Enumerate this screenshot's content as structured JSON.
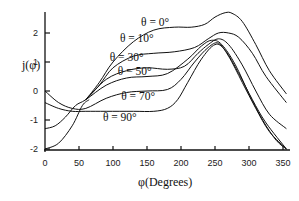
{
  "chart_data": {
    "type": "line",
    "title": "",
    "xlabel": "φ(Degrees)",
    "ylabel": "j(φ)",
    "xlim": [
      0,
      360
    ],
    "ylim": [
      -2,
      2.7
    ],
    "grid": false,
    "legend": "inline labels",
    "xticks": [
      0,
      50,
      100,
      150,
      200,
      250,
      300,
      350
    ],
    "yticks": [
      -2,
      -1,
      0,
      1,
      2
    ],
    "series": [
      {
        "name": "θ = 0°",
        "x": [
          60,
          80,
          100,
          130,
          160,
          190,
          215,
          235,
          250,
          265,
          275,
          290,
          310,
          330,
          355
        ],
        "y": [
          -0.3,
          0.3,
          1.0,
          1.7,
          2.1,
          2.2,
          2.2,
          2.3,
          2.55,
          2.7,
          2.68,
          2.4,
          1.6,
          0.7,
          -0.1
        ]
      },
      {
        "name": "θ = 10°",
        "x": [
          60,
          80,
          100,
          130,
          160,
          190,
          220,
          240,
          255,
          270,
          285,
          305,
          325,
          355
        ],
        "y": [
          -0.3,
          0.2,
          0.8,
          1.2,
          1.3,
          1.35,
          1.5,
          1.8,
          2.0,
          2.0,
          1.85,
          1.3,
          0.5,
          -0.4
        ]
      },
      {
        "name": "θ = 30°",
        "x": [
          60,
          90,
          120,
          150,
          180,
          205,
          225,
          240,
          255,
          270,
          290,
          310,
          330,
          355
        ],
        "y": [
          -0.3,
          0.4,
          0.7,
          0.8,
          0.75,
          0.85,
          1.3,
          1.6,
          1.8,
          1.6,
          0.9,
          0.0,
          -0.8,
          -1.3
        ]
      },
      {
        "name": "θ = 50°",
        "x": [
          0,
          15,
          30,
          45,
          60,
          90,
          120,
          150,
          180,
          210,
          230,
          245,
          260,
          280,
          300,
          320,
          340,
          355
        ],
        "y": [
          -1.3,
          -1.2,
          -0.9,
          -0.5,
          -0.3,
          0.2,
          0.45,
          0.5,
          0.6,
          1.1,
          1.55,
          1.75,
          1.6,
          0.9,
          -0.1,
          -1.0,
          -1.7,
          -2.0
        ]
      },
      {
        "name": "θ = 70°",
        "x": [
          0,
          20,
          40,
          60,
          90,
          120,
          150,
          180,
          200,
          220,
          240,
          255,
          270,
          290,
          310,
          330,
          355
        ],
        "y": [
          0.0,
          -0.4,
          -0.6,
          -0.6,
          -0.25,
          -0.05,
          0.0,
          0.05,
          0.4,
          1.0,
          1.5,
          1.65,
          1.2,
          0.3,
          -0.6,
          -1.4,
          -2.0
        ]
      },
      {
        "name": "θ = 90°",
        "x": [
          0,
          20,
          40,
          60,
          90,
          130,
          160,
          180,
          195,
          210,
          230,
          250,
          265,
          285,
          305,
          325,
          355
        ],
        "y": [
          -0.4,
          -0.6,
          -0.7,
          -0.7,
          -0.7,
          -0.7,
          -0.7,
          -0.6,
          -0.3,
          0.3,
          1.1,
          1.6,
          1.4,
          0.6,
          -0.3,
          -1.1,
          -2.0
        ]
      },
      {
        "name": "θ = 90° (lower branch)",
        "x": [
          0,
          20,
          40,
          55,
          65
        ],
        "y": [
          -2.0,
          -1.8,
          -1.2,
          -0.5,
          -0.3
        ]
      }
    ],
    "labels": [
      {
        "text": "θ = 0°",
        "x": 162,
        "y": 2.25
      },
      {
        "text": "θ = 10°",
        "x": 135,
        "y": 1.7
      },
      {
        "text": "θ = 30°",
        "x": 120,
        "y": 1.05
      },
      {
        "text": "θ = 50°",
        "x": 132,
        "y": 0.55
      },
      {
        "text": "θ = 70°",
        "x": 137,
        "y": -0.3
      },
      {
        "text": "θ = 90°",
        "x": 110,
        "y": -1.05
      }
    ]
  },
  "axes": {
    "xlabel": "φ(Degrees)",
    "ylabel": "j(φ)",
    "xtick_labels": [
      "0",
      "50",
      "100",
      "150",
      "200",
      "250",
      "300",
      "350"
    ],
    "ytick_labels": [
      "2",
      "1",
      "0",
      "-1",
      "-2"
    ]
  }
}
